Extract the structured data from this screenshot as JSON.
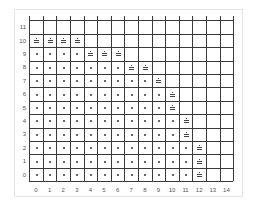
{
  "chart_data": {
    "type": "scatter",
    "title": "",
    "xlabel": "",
    "ylabel": "",
    "x_ticks": [
      "0",
      "1",
      "2",
      "3",
      "4",
      "5",
      "6",
      "7",
      "8",
      "9",
      "10",
      "11",
      "12",
      "13",
      "14"
    ],
    "y_ticks": [
      "0",
      "1",
      "2",
      "3",
      "4",
      "5",
      "6",
      "7",
      "8",
      "9",
      "10",
      "11"
    ],
    "xlim": [
      -0.5,
      14.5
    ],
    "ylim": [
      -0.5,
      11.5
    ],
    "grid": true,
    "legend": null,
    "series": [
      {
        "name": "interior-dots",
        "marker": "dot",
        "rows": [
          {
            "y": 0,
            "x_from": 0,
            "x_to": 11
          },
          {
            "y": 1,
            "x_from": 0,
            "x_to": 11
          },
          {
            "y": 2,
            "x_from": 0,
            "x_to": 11
          },
          {
            "y": 3,
            "x_from": 0,
            "x_to": 10
          },
          {
            "y": 4,
            "x_from": 0,
            "x_to": 10
          },
          {
            "y": 5,
            "x_from": 0,
            "x_to": 9
          },
          {
            "y": 6,
            "x_from": 0,
            "x_to": 9
          },
          {
            "y": 7,
            "x_from": 0,
            "x_to": 8
          },
          {
            "y": 8,
            "x_from": 0,
            "x_to": 6
          },
          {
            "y": 9,
            "x_from": 0,
            "x_to": 3
          }
        ]
      },
      {
        "name": "boundary-markers",
        "marker": "bar-dot",
        "points": [
          [
            0,
            10
          ],
          [
            1,
            10
          ],
          [
            2,
            10
          ],
          [
            3,
            10
          ],
          [
            4,
            9
          ],
          [
            5,
            9
          ],
          [
            6,
            9
          ],
          [
            7,
            8
          ],
          [
            8,
            8
          ],
          [
            9,
            7
          ],
          [
            10,
            6
          ],
          [
            10,
            5
          ],
          [
            11,
            4
          ],
          [
            11,
            3
          ],
          [
            12,
            2
          ],
          [
            12,
            1
          ],
          [
            12,
            0
          ]
        ]
      }
    ]
  }
}
